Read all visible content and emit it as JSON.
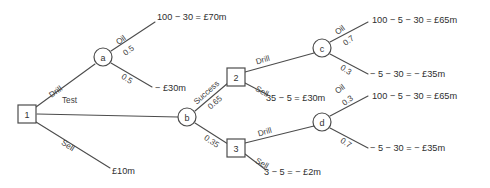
{
  "diagram": {
    "colors": {
      "line": "#4c4c4c",
      "text": "#2e2e2e",
      "background": "#ffffff"
    },
    "nodes": [
      {
        "id": "n1",
        "label": "1",
        "shape": "square",
        "x": 27,
        "y": 114
      },
      {
        "id": "a",
        "label": "a",
        "shape": "circle",
        "x": 103,
        "y": 57
      },
      {
        "id": "b",
        "label": "b",
        "shape": "circle",
        "x": 187,
        "y": 117
      },
      {
        "id": "n2",
        "label": "2",
        "shape": "square",
        "x": 236,
        "y": 77
      },
      {
        "id": "n3",
        "label": "3",
        "shape": "square",
        "x": 236,
        "y": 148
      },
      {
        "id": "c",
        "label": "c",
        "shape": "circle",
        "x": 322,
        "y": 48
      },
      {
        "id": "d",
        "label": "d",
        "shape": "circle",
        "x": 322,
        "y": 122
      }
    ],
    "edges": [
      {
        "id": "e-drill",
        "from": "n1",
        "to": "a",
        "x1": 36,
        "y1": 107,
        "x2": 95,
        "y2": 64
      },
      {
        "id": "e-test",
        "from": "n1",
        "to": "b",
        "x1": 37,
        "y1": 114,
        "x2": 178,
        "y2": 117
      },
      {
        "id": "e-sell",
        "from": "n1",
        "to": "sell-payoff",
        "x1": 36,
        "y1": 122,
        "x2": 110,
        "y2": 168
      },
      {
        "id": "e-a-oil",
        "from": "a",
        "to": "oil-payoff",
        "x1": 111,
        "y1": 51,
        "x2": 155,
        "y2": 22
      },
      {
        "id": "e-a-dry",
        "from": "a",
        "to": "dry-payoff",
        "x1": 111,
        "y1": 63,
        "x2": 152,
        "y2": 87
      },
      {
        "id": "e-b-success",
        "from": "b",
        "to": "n2",
        "x1": 195,
        "y1": 111,
        "x2": 228,
        "y2": 83
      },
      {
        "id": "e-b-failure",
        "from": "b",
        "to": "n3",
        "x1": 195,
        "y1": 123,
        "x2": 228,
        "y2": 144
      },
      {
        "id": "e-n2-drill",
        "from": "n2",
        "to": "c",
        "x1": 245,
        "y1": 72,
        "x2": 314,
        "y2": 53
      },
      {
        "id": "e-n2-sell",
        "from": "n2",
        "to": "n2-sell-payoff",
        "x1": 245,
        "y1": 83,
        "x2": 268,
        "y2": 95
      },
      {
        "id": "e-n3-drill",
        "from": "n3",
        "to": "d",
        "x1": 245,
        "y1": 143,
        "x2": 314,
        "y2": 126
      },
      {
        "id": "e-n3-sell",
        "from": "n3",
        "to": "n3-sell-payoff",
        "x1": 245,
        "y1": 154,
        "x2": 266,
        "y2": 170
      },
      {
        "id": "e-c-oil",
        "from": "c",
        "to": "c-oil-payoff",
        "x1": 330,
        "y1": 42,
        "x2": 368,
        "y2": 22
      },
      {
        "id": "e-c-dry",
        "from": "c",
        "to": "c-dry-payoff",
        "x1": 330,
        "y1": 54,
        "x2": 368,
        "y2": 74
      },
      {
        "id": "e-d-oil",
        "from": "d",
        "to": "d-oil-payoff",
        "x1": 330,
        "y1": 116,
        "x2": 368,
        "y2": 96
      },
      {
        "id": "e-d-dry",
        "from": "d",
        "to": "d-dry-payoff",
        "x1": 330,
        "y1": 128,
        "x2": 368,
        "y2": 148
      }
    ],
    "edge_labels": [
      {
        "id": "lbl-drill",
        "text": "Drill",
        "x": 50,
        "y": 96,
        "rotate": -36
      },
      {
        "id": "lbl-test",
        "text": "Test",
        "x": 62,
        "y": 100,
        "rotate": 0
      },
      {
        "id": "lbl-sell",
        "text": "Sell",
        "x": 62,
        "y": 142,
        "rotate": 32
      },
      {
        "id": "lbl-a-oil",
        "text": "Oil",
        "x": 117,
        "y": 43,
        "rotate": -36
      },
      {
        "id": "lbl-a-oil-prob",
        "text": "0.5",
        "x": 124,
        "y": 54,
        "rotate": -36
      },
      {
        "id": "lbl-a-dry-prob",
        "text": "0.5",
        "x": 122,
        "y": 76,
        "rotate": 32
      },
      {
        "id": "lbl-b-success",
        "text": "Success",
        "x": 195,
        "y": 103,
        "rotate": -42
      },
      {
        "id": "lbl-b-success-prob",
        "text": "0.65",
        "x": 209,
        "y": 108,
        "rotate": -42
      },
      {
        "id": "lbl-b-failure-prob",
        "text": "0.35",
        "x": 205,
        "y": 137,
        "rotate": 35
      },
      {
        "id": "lbl-n2-drill",
        "text": "Drill",
        "x": 256,
        "y": 62,
        "rotate": -16
      },
      {
        "id": "lbl-n2-sell",
        "text": "Sell",
        "x": 256,
        "y": 88,
        "rotate": 30
      },
      {
        "id": "lbl-n3-drill",
        "text": "Drill",
        "x": 258,
        "y": 134,
        "rotate": -16
      },
      {
        "id": "lbl-n3-sell",
        "text": "Sell",
        "x": 256,
        "y": 160,
        "rotate": 30
      },
      {
        "id": "lbl-c-oil",
        "text": "Oil",
        "x": 336,
        "y": 33,
        "rotate": -36
      },
      {
        "id": "lbl-c-oil-prob",
        "text": "0.7",
        "x": 344,
        "y": 44,
        "rotate": -36
      },
      {
        "id": "lbl-c-dry-prob",
        "text": "0.3",
        "x": 341,
        "y": 67,
        "rotate": 32
      },
      {
        "id": "lbl-d-oil",
        "text": "Oil",
        "x": 336,
        "y": 92,
        "rotate": -36
      },
      {
        "id": "lbl-d-oil-prob",
        "text": "0.3",
        "x": 343,
        "y": 104,
        "rotate": -36
      },
      {
        "id": "lbl-d-dry-prob",
        "text": "0.7",
        "x": 341,
        "y": 140,
        "rotate": 32
      }
    ],
    "payoffs": [
      {
        "id": "oil-payoff",
        "text": "100 − 30 = £70m",
        "x": 157,
        "y": 17
      },
      {
        "id": "dry-payoff",
        "text": "− £30m",
        "x": 155,
        "y": 88
      },
      {
        "id": "sell-payoff",
        "text": "£10m",
        "x": 112,
        "y": 171
      },
      {
        "id": "n2-sell-payoff",
        "text": "35 − 5 = £30m",
        "x": 266,
        "y": 98
      },
      {
        "id": "n3-sell-payoff",
        "text": "3 − 5 = − £2m",
        "x": 264,
        "y": 172
      },
      {
        "id": "c-oil-payoff",
        "text": "100 − 5 − 30 = £65m",
        "x": 372,
        "y": 20
      },
      {
        "id": "c-dry-payoff",
        "text": "− 5 − 30 = − £35m",
        "x": 370,
        "y": 74
      },
      {
        "id": "d-oil-payoff",
        "text": "100 − 5 − 30 = £65m",
        "x": 372,
        "y": 96
      },
      {
        "id": "d-dry-payoff",
        "text": "− 5 − 30 = − £35m",
        "x": 370,
        "y": 148
      }
    ]
  }
}
